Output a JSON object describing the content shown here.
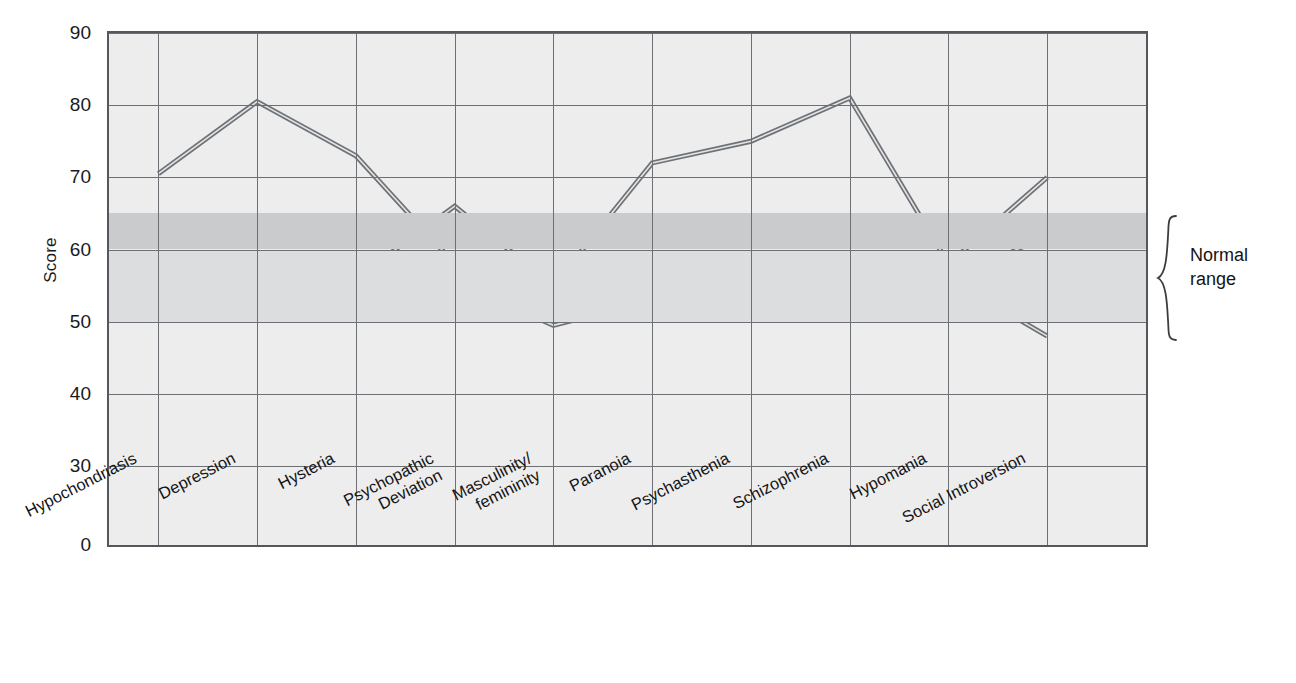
{
  "chart_data": {
    "type": "line",
    "title": "",
    "xlabel": "",
    "ylabel": "Score",
    "categories": [
      "Hypochondriasis",
      "Depression",
      "Hysteria",
      "Psychopathic\nDeviation",
      "Masculinity/\nfemininity",
      "Paranoia",
      "Psychasthenia",
      "Schizophrenia",
      "Hypomania",
      "Social Introversion"
    ],
    "yticks": [
      0,
      30,
      40,
      50,
      60,
      70,
      80,
      90
    ],
    "ytick_labels": [
      "0",
      "30",
      "40",
      "50",
      "60",
      "70",
      "80",
      "90"
    ],
    "ylim": [
      0,
      90
    ],
    "axis_break": true,
    "grid": true,
    "legend": "none",
    "series": [
      {
        "name": "profile-1",
        "values": [
          70.5,
          80.5,
          73,
          58,
          55,
          72,
          75,
          81,
          58,
          70
        ]
      },
      {
        "name": "profile-2",
        "values": [
          54.5,
          55.5,
          56,
          66,
          55,
          55.5,
          58,
          57.5,
          55.5,
          62
        ]
      },
      {
        "name": "profile-3",
        "values": [
          52.5,
          53,
          51,
          55.5,
          49.5,
          53,
          55,
          52.5,
          56,
          48
        ]
      }
    ],
    "shaded_regions": [
      {
        "name": "normal-range-upper",
        "from": 60,
        "to": 65,
        "color": "#c9cbcd"
      },
      {
        "name": "normal-range-lower",
        "from": 50,
        "to": 60,
        "color": "#dcdddf"
      }
    ],
    "annotations": [
      {
        "name": "normal-range",
        "text_line1": "Normal",
        "text_line2": "range",
        "from": 50,
        "to": 65
      }
    ],
    "colors": {
      "plot_background": "#ededed",
      "grid": "#6c7075",
      "axis": "#54585c",
      "line": "#6e7277",
      "band_dark": "#c9cbcd",
      "band_light": "#dcdddf"
    }
  },
  "annotation": {
    "normal_range_line1": "Normal",
    "normal_range_line2": "range"
  }
}
